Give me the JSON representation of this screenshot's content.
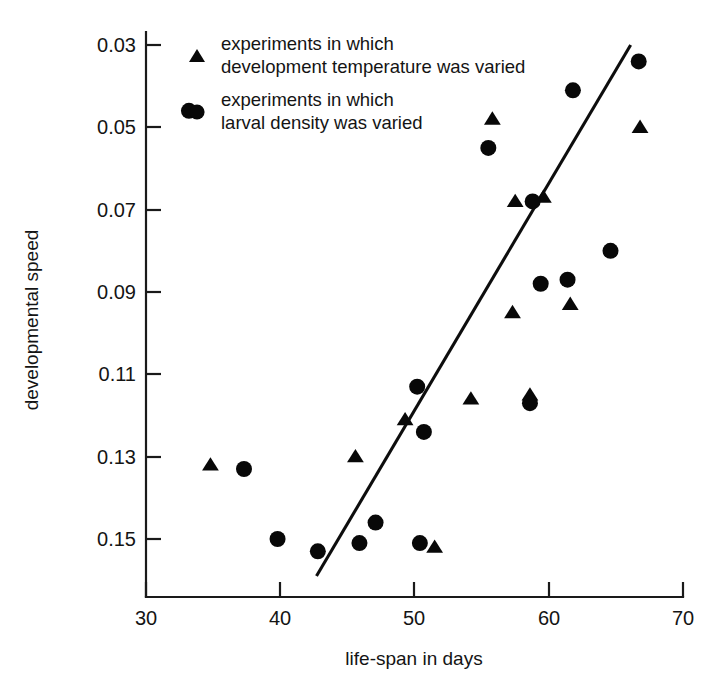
{
  "chart_data": {
    "type": "scatter",
    "title": "",
    "xlabel": "life-span in days",
    "ylabel": "developmental speed",
    "xlim": [
      30,
      70
    ],
    "ylim": [
      0.03,
      0.155
    ],
    "y_axis_inverted": true,
    "grid": false,
    "xticks": [
      30,
      40,
      50,
      60,
      70
    ],
    "xtick_labels": [
      "30",
      "40",
      "50",
      "60",
      "70"
    ],
    "yticks": [
      0.03,
      0.05,
      0.07,
      0.09,
      0.11,
      0.13,
      0.15
    ],
    "ytick_labels": [
      "0.03",
      "0.05",
      "0.07",
      "0.09",
      "0.11",
      "0.13",
      "0.15"
    ],
    "legend_position": "top-left-inside",
    "series": [
      {
        "name": "experiments in which development temperature was varied",
        "marker": "triangle",
        "color": "#080808",
        "points": [
          {
            "x": 34.8,
            "y": 0.132
          },
          {
            "x": 45.6,
            "y": 0.13
          },
          {
            "x": 51.5,
            "y": 0.152
          },
          {
            "x": 49.3,
            "y": 0.121
          },
          {
            "x": 54.2,
            "y": 0.116
          },
          {
            "x": 55.8,
            "y": 0.048
          },
          {
            "x": 57.5,
            "y": 0.068
          },
          {
            "x": 59.6,
            "y": 0.067
          },
          {
            "x": 58.6,
            "y": 0.115
          },
          {
            "x": 57.3,
            "y": 0.095
          },
          {
            "x": 61.6,
            "y": 0.093
          },
          {
            "x": 66.8,
            "y": 0.05
          }
        ]
      },
      {
        "name": "experiments in which larval density was varied",
        "marker": "circle",
        "color": "#080808",
        "points": [
          {
            "x": 33.2,
            "y": 0.046
          },
          {
            "x": 37.3,
            "y": 0.133
          },
          {
            "x": 39.8,
            "y": 0.15
          },
          {
            "x": 42.8,
            "y": 0.153
          },
          {
            "x": 45.9,
            "y": 0.151
          },
          {
            "x": 47.1,
            "y": 0.146
          },
          {
            "x": 50.4,
            "y": 0.151
          },
          {
            "x": 50.2,
            "y": 0.113
          },
          {
            "x": 50.7,
            "y": 0.124
          },
          {
            "x": 55.5,
            "y": 0.055
          },
          {
            "x": 58.6,
            "y": 0.117
          },
          {
            "x": 58.8,
            "y": 0.068
          },
          {
            "x": 59.4,
            "y": 0.088
          },
          {
            "x": 61.4,
            "y": 0.087
          },
          {
            "x": 61.8,
            "y": 0.041
          },
          {
            "x": 64.6,
            "y": 0.08
          },
          {
            "x": 66.7,
            "y": 0.034
          }
        ]
      }
    ],
    "trend_line": {
      "name": "regression line",
      "x0": 42.7,
      "y0": 0.159,
      "x1": 66.1,
      "y1": 0.03
    },
    "legend": [
      {
        "marker": "triangle",
        "line1": "experiments in which",
        "line2": "development temperature was varied"
      },
      {
        "marker": "circle",
        "line1": "experiments in which",
        "line2": "larval density was varied"
      }
    ]
  }
}
